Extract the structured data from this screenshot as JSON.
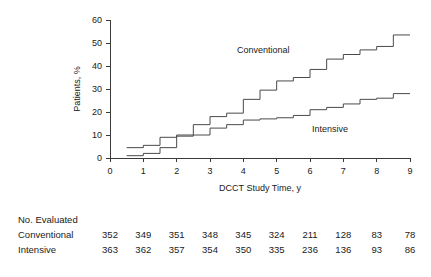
{
  "figure": {
    "name": "dcct-cumulative-incidence-figure"
  },
  "chart_data": {
    "type": "line",
    "subtype": "step",
    "title": "",
    "xlabel": "DCCT Study Time, y",
    "ylabel": "Patients, %",
    "xlim": [
      0,
      9
    ],
    "ylim": [
      0,
      60
    ],
    "xticks": [
      0,
      1,
      2,
      3,
      4,
      5,
      6,
      7,
      8,
      9
    ],
    "yticks": [
      0,
      10,
      20,
      30,
      40,
      50,
      60
    ],
    "xticklabels": [
      "0",
      "1",
      "2",
      "3",
      "4",
      "5",
      "6",
      "7",
      "8",
      "9"
    ],
    "yticklabels": [
      "0",
      "10",
      "20",
      "30",
      "40",
      "50",
      "60"
    ],
    "grid": false,
    "legend_position": "inline-annotations",
    "series": [
      {
        "name": "Conventional",
        "label_x": 4.6,
        "label_y": 45.5,
        "x": [
          0.5,
          1.0,
          1.0,
          1.5,
          1.5,
          2.0,
          2.0,
          2.5,
          2.5,
          3.0,
          3.0,
          3.5,
          3.5,
          4.0,
          4.0,
          4.5,
          4.5,
          5.0,
          5.0,
          5.5,
          5.5,
          6.0,
          6.0,
          6.5,
          6.5,
          7.0,
          7.0,
          7.5,
          7.5,
          8.0,
          8.0,
          8.5,
          8.5,
          9.0
        ],
        "y": [
          4.5,
          4.5,
          5.5,
          5.5,
          9.0,
          9.0,
          10.0,
          10.0,
          14.5,
          14.5,
          18.0,
          18.0,
          19.5,
          19.5,
          25.5,
          25.5,
          29.5,
          29.5,
          33.5,
          33.5,
          35.0,
          35.0,
          38.5,
          38.5,
          43.0,
          43.0,
          45.0,
          45.0,
          47.0,
          47.0,
          48.5,
          48.5,
          53.5,
          53.5
        ]
      },
      {
        "name": "Intensive",
        "label_x": 6.6,
        "label_y": 11.5,
        "x": [
          0.5,
          1.0,
          1.0,
          1.5,
          1.5,
          2.0,
          2.0,
          2.5,
          2.5,
          3.0,
          3.0,
          3.5,
          3.5,
          4.0,
          4.0,
          4.5,
          4.5,
          5.0,
          5.0,
          5.5,
          5.5,
          6.0,
          6.0,
          6.5,
          6.5,
          7.0,
          7.0,
          7.5,
          7.5,
          8.0,
          8.0,
          8.5,
          8.5,
          9.0
        ],
        "y": [
          1.0,
          1.0,
          2.0,
          2.0,
          4.5,
          4.5,
          9.5,
          9.5,
          10.0,
          10.0,
          13.0,
          13.0,
          14.5,
          14.5,
          16.5,
          16.5,
          17.0,
          17.0,
          17.5,
          17.5,
          18.5,
          18.5,
          21.0,
          21.0,
          22.0,
          22.0,
          23.5,
          23.5,
          25.5,
          25.5,
          26.0,
          26.0,
          28.0,
          28.0
        ]
      }
    ]
  },
  "risk_table": {
    "header": "No. Evaluated",
    "columns": [
      0,
      1,
      2,
      3,
      4,
      5,
      6,
      7,
      8,
      9
    ],
    "rows": [
      {
        "label": "Conventional",
        "values": [
          "352",
          "349",
          "351",
          "348",
          "345",
          "324",
          "211",
          "128",
          "83",
          "78"
        ]
      },
      {
        "label": "Intensive",
        "values": [
          "363",
          "362",
          "357",
          "354",
          "350",
          "335",
          "236",
          "136",
          "93",
          "86"
        ]
      }
    ]
  },
  "colors": {
    "line": "#4a4a4a",
    "axis": "#3a3a3a",
    "text": "#1a1a1a",
    "background": "#ffffff"
  }
}
